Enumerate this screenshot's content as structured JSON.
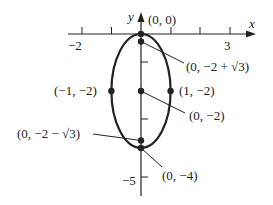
{
  "diagram": {
    "axes": {
      "x_label": "x",
      "y_label": "y",
      "x_ticks": [
        "-2",
        "3"
      ],
      "y_ticks": [
        "-5"
      ]
    },
    "points": {
      "origin": "(0, 0)",
      "focus_top": "(0, −2 + √3)",
      "left": "(−1, −2)",
      "right": "(1, −2)",
      "center": "(0, −2)",
      "focus_bottom": "(0, −2 − √3)",
      "bottom": "(0, −4)"
    },
    "tick_labels": {
      "x_neg2": "−2",
      "x_3": "3",
      "y_neg5": "−5"
    }
  }
}
